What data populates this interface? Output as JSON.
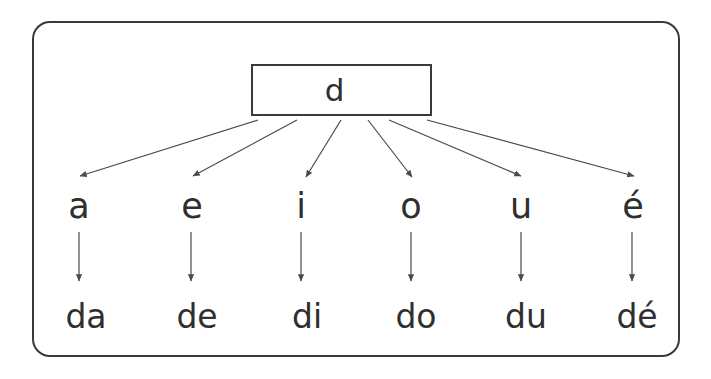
{
  "diagram": {
    "type": "syllable-tree",
    "title_glyph": "d",
    "root": {
      "label": "d",
      "shape": "rectangle"
    },
    "branches": [
      {
        "vowel": "a",
        "syllable": "da"
      },
      {
        "vowel": "e",
        "syllable": "de"
      },
      {
        "vowel": "i",
        "syllable": "di"
      },
      {
        "vowel": "o",
        "syllable": "do"
      },
      {
        "vowel": "u",
        "syllable": "du"
      },
      {
        "vowel": "é",
        "syllable": "dé"
      }
    ],
    "colors": {
      "stroke": "#3a3a3a",
      "text": "#2f2f2f",
      "background": "#ffffff",
      "arrow": "#4a4a4a"
    }
  }
}
